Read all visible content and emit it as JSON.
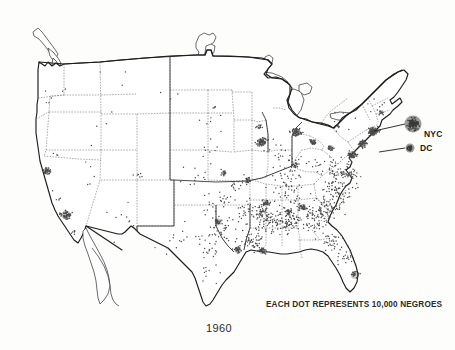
{
  "figure": {
    "year_label": "1960",
    "legend_caption": "EACH DOT REPRESENTS 10,000 NEGROES",
    "background_color": "#fdfdfc",
    "ink_color": "#1d1d1d",
    "dot_color": "#4a4a4a"
  },
  "callouts": [
    {
      "id": "nyc",
      "label": "NYC",
      "marker": "large-blob",
      "marker_radius": 8.5,
      "marker_x": 413,
      "marker_y": 124,
      "label_x": 424,
      "label_y": 137,
      "leader_from_x": 374,
      "leader_from_y": 131,
      "leader_to_x": 405,
      "leader_to_y": 124
    },
    {
      "id": "dc",
      "label": "DC",
      "marker": "small-blob",
      "marker_radius": 4.5,
      "marker_x": 410,
      "marker_y": 148,
      "label_x": 420,
      "label_y": 151,
      "leader_from_x": 379,
      "leader_from_y": 152,
      "leader_to_x": 405,
      "leader_to_y": 148
    }
  ],
  "chart_data": {
    "type": "dot-density-map",
    "subtitle": "1960",
    "legend": "EACH DOT REPRESENTS 10,000 NEGROES",
    "dot_value": 10000,
    "dot_unit": "persons",
    "region": "Conterminous United States",
    "projection": "Albers equal-area conic",
    "annotations": [
      "NYC",
      "DC"
    ],
    "density_classes": [
      {
        "name": "very-sparse",
        "dots_per_cell": 1,
        "regions": [
          "Mountain West",
          "Northern Plains",
          "Upper New England"
        ]
      },
      {
        "name": "sparse",
        "dots_per_cell": 4,
        "regions": [
          "Central Plains",
          "West Texas",
          "Pacific Northwest"
        ]
      },
      {
        "name": "moderate",
        "dots_per_cell": 12,
        "regions": [
          "Lower Midwest",
          "Ohio Valley",
          "East Texas"
        ]
      },
      {
        "name": "dense",
        "dots_per_cell": 34,
        "regions": [
          "Deep South",
          "Atlantic Coastal Plain",
          "Mississippi Delta"
        ]
      },
      {
        "name": "urban-cluster",
        "dots_per_cell": 90,
        "regions": [
          "Metropolitan concentrations"
        ]
      }
    ],
    "regions": [
      {
        "name": "San Francisco Bay Area",
        "x": 47,
        "y": 171,
        "dots": 34,
        "spread": 4.5,
        "class": "urban-cluster"
      },
      {
        "name": "Los Angeles",
        "x": 66,
        "y": 215,
        "dots": 48,
        "spread": 5.5,
        "class": "urban-cluster"
      },
      {
        "name": "San Diego",
        "x": 74,
        "y": 232,
        "dots": 7,
        "spread": 2.6,
        "class": "moderate"
      },
      {
        "name": "Central California",
        "x": 58,
        "y": 195,
        "dots": 5,
        "spread": 10,
        "class": "sparse"
      },
      {
        "name": "Sacramento Valley",
        "x": 52,
        "y": 157,
        "dots": 3,
        "spread": 7,
        "class": "sparse"
      },
      {
        "name": "Pacific Northwest",
        "x": 60,
        "y": 90,
        "dots": 4,
        "spread": 14,
        "class": "sparse"
      },
      {
        "name": "Portland",
        "x": 48,
        "y": 104,
        "dots": 2,
        "spread": 2.2,
        "class": "moderate"
      },
      {
        "name": "Montana",
        "x": 120,
        "y": 85,
        "dots": 3,
        "spread": 26,
        "class": "very-sparse"
      },
      {
        "name": "Idaho-Wyoming",
        "x": 105,
        "y": 125,
        "dots": 4,
        "spread": 24,
        "class": "very-sparse"
      },
      {
        "name": "Nevada-Utah",
        "x": 90,
        "y": 170,
        "dots": 5,
        "spread": 22,
        "class": "very-sparse"
      },
      {
        "name": "Arizona-New Mexico",
        "x": 120,
        "y": 215,
        "dots": 9,
        "spread": 26,
        "class": "sparse"
      },
      {
        "name": "Colorado Front Range",
        "x": 140,
        "y": 175,
        "dots": 6,
        "spread": 8,
        "class": "moderate"
      },
      {
        "name": "Dakotas",
        "x": 175,
        "y": 95,
        "dots": 3,
        "spread": 22,
        "class": "very-sparse"
      },
      {
        "name": "Nebraska-Omaha",
        "x": 205,
        "y": 148,
        "dots": 7,
        "spread": 11,
        "class": "sparse"
      },
      {
        "name": "Kansas",
        "x": 196,
        "y": 180,
        "dots": 12,
        "spread": 17,
        "class": "moderate"
      },
      {
        "name": "Kansas City",
        "x": 224,
        "y": 173,
        "dots": 14,
        "spread": 3.2,
        "class": "urban-cluster"
      },
      {
        "name": "Missouri",
        "x": 236,
        "y": 186,
        "dots": 16,
        "spread": 12,
        "class": "moderate"
      },
      {
        "name": "St. Louis",
        "x": 248,
        "y": 180,
        "dots": 20,
        "spread": 3.4,
        "class": "urban-cluster"
      },
      {
        "name": "Iowa-Minnesota",
        "x": 215,
        "y": 125,
        "dots": 6,
        "spread": 18,
        "class": "very-sparse"
      },
      {
        "name": "Minneapolis",
        "x": 214,
        "y": 108,
        "dots": 4,
        "spread": 2.4,
        "class": "moderate"
      },
      {
        "name": "Chicago",
        "x": 262,
        "y": 142,
        "dots": 62,
        "spread": 5.2,
        "class": "urban-cluster"
      },
      {
        "name": "Milwaukee",
        "x": 259,
        "y": 127,
        "dots": 10,
        "spread": 2.6,
        "class": "urban-cluster"
      },
      {
        "name": "Detroit",
        "x": 296,
        "y": 132,
        "dots": 52,
        "spread": 4.8,
        "class": "urban-cluster"
      },
      {
        "name": "Cleveland",
        "x": 313,
        "y": 142,
        "dots": 26,
        "spread": 3.6,
        "class": "urban-cluster"
      },
      {
        "name": "Indiana-Ohio",
        "x": 288,
        "y": 158,
        "dots": 30,
        "spread": 18,
        "class": "moderate"
      },
      {
        "name": "Cincinnati",
        "x": 295,
        "y": 165,
        "dots": 14,
        "spread": 3.0,
        "class": "urban-cluster"
      },
      {
        "name": "Pittsburgh",
        "x": 331,
        "y": 148,
        "dots": 18,
        "spread": 3.4,
        "class": "urban-cluster"
      },
      {
        "name": "Buffalo",
        "x": 337,
        "y": 126,
        "dots": 8,
        "spread": 2.6,
        "class": "moderate"
      },
      {
        "name": "Upstate New York",
        "x": 345,
        "y": 118,
        "dots": 6,
        "spread": 14,
        "class": "sparse"
      },
      {
        "name": "New England",
        "x": 378,
        "y": 104,
        "dots": 7,
        "spread": 13,
        "class": "sparse"
      },
      {
        "name": "Boston",
        "x": 381,
        "y": 112,
        "dots": 10,
        "spread": 2.8,
        "class": "urban-cluster"
      },
      {
        "name": "New York City",
        "x": 373,
        "y": 131,
        "dots": 72,
        "spread": 5.0,
        "class": "urban-cluster"
      },
      {
        "name": "Philadelphia",
        "x": 363,
        "y": 144,
        "dots": 40,
        "spread": 4.2,
        "class": "urban-cluster"
      },
      {
        "name": "Baltimore-Washington",
        "x": 352,
        "y": 155,
        "dots": 44,
        "spread": 4.6,
        "class": "urban-cluster"
      },
      {
        "name": "Virginia Piedmont",
        "x": 338,
        "y": 170,
        "dots": 44,
        "spread": 14,
        "class": "dense"
      },
      {
        "name": "Tidewater Virginia",
        "x": 352,
        "y": 174,
        "dots": 26,
        "spread": 8,
        "class": "dense"
      },
      {
        "name": "West Virginia",
        "x": 320,
        "y": 165,
        "dots": 12,
        "spread": 11,
        "class": "moderate"
      },
      {
        "name": "Kentucky",
        "x": 290,
        "y": 180,
        "dots": 26,
        "spread": 18,
        "class": "moderate"
      },
      {
        "name": "Tennessee",
        "x": 290,
        "y": 196,
        "dots": 40,
        "spread": 20,
        "class": "dense"
      },
      {
        "name": "Memphis",
        "x": 266,
        "y": 203,
        "dots": 22,
        "spread": 3.6,
        "class": "urban-cluster"
      },
      {
        "name": "North Carolina",
        "x": 336,
        "y": 190,
        "dots": 66,
        "spread": 17,
        "class": "dense"
      },
      {
        "name": "South Carolina",
        "x": 327,
        "y": 208,
        "dots": 58,
        "spread": 13,
        "class": "dense"
      },
      {
        "name": "Georgia",
        "x": 311,
        "y": 219,
        "dots": 72,
        "spread": 16,
        "class": "dense"
      },
      {
        "name": "Atlanta",
        "x": 303,
        "y": 207,
        "dots": 24,
        "spread": 3.8,
        "class": "urban-cluster"
      },
      {
        "name": "Alabama",
        "x": 288,
        "y": 222,
        "dots": 68,
        "spread": 13,
        "class": "dense"
      },
      {
        "name": "Birmingham",
        "x": 288,
        "y": 212,
        "dots": 20,
        "spread": 3.4,
        "class": "urban-cluster"
      },
      {
        "name": "Mississippi",
        "x": 269,
        "y": 222,
        "dots": 64,
        "spread": 12,
        "class": "dense"
      },
      {
        "name": "Mississippi Delta",
        "x": 262,
        "y": 211,
        "dots": 30,
        "spread": 7,
        "class": "dense"
      },
      {
        "name": "Louisiana",
        "x": 253,
        "y": 240,
        "dots": 52,
        "spread": 13,
        "class": "dense"
      },
      {
        "name": "New Orleans",
        "x": 262,
        "y": 251,
        "dots": 26,
        "spread": 3.8,
        "class": "urban-cluster"
      },
      {
        "name": "Arkansas",
        "x": 248,
        "y": 213,
        "dots": 36,
        "spread": 14,
        "class": "dense"
      },
      {
        "name": "Oklahoma",
        "x": 215,
        "y": 205,
        "dots": 16,
        "spread": 19,
        "class": "moderate"
      },
      {
        "name": "Oklahoma City-Tulsa",
        "x": 224,
        "y": 200,
        "dots": 10,
        "spread": 6,
        "class": "moderate"
      },
      {
        "name": "East Texas",
        "x": 225,
        "y": 232,
        "dots": 30,
        "spread": 15,
        "class": "dense"
      },
      {
        "name": "Dallas-Fort Worth",
        "x": 218,
        "y": 222,
        "dots": 22,
        "spread": 4.2,
        "class": "urban-cluster"
      },
      {
        "name": "Houston",
        "x": 238,
        "y": 250,
        "dots": 26,
        "spread": 4.2,
        "class": "urban-cluster"
      },
      {
        "name": "Central Texas",
        "x": 205,
        "y": 248,
        "dots": 22,
        "spread": 17,
        "class": "moderate"
      },
      {
        "name": "West Texas",
        "x": 178,
        "y": 240,
        "dots": 14,
        "spread": 22,
        "class": "sparse"
      },
      {
        "name": "South Texas",
        "x": 208,
        "y": 272,
        "dots": 10,
        "spread": 16,
        "class": "sparse"
      },
      {
        "name": "North Florida",
        "x": 330,
        "y": 240,
        "dots": 34,
        "spread": 13,
        "class": "dense"
      },
      {
        "name": "Central Florida",
        "x": 343,
        "y": 257,
        "dots": 22,
        "spread": 10,
        "class": "moderate"
      },
      {
        "name": "South Florida-Miami",
        "x": 355,
        "y": 275,
        "dots": 18,
        "spread": 5,
        "class": "urban-cluster"
      }
    ]
  }
}
